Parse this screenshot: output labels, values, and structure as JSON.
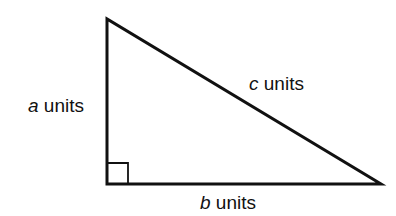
{
  "diagram": {
    "type": "right-triangle",
    "stroke_color": "#111111",
    "background": "#ffffff",
    "vertices": {
      "top": [
        107,
        19
      ],
      "right_angle": [
        107,
        184
      ],
      "right": [
        381,
        184
      ]
    },
    "right_angle_marker_size": 21,
    "labels": {
      "a": {
        "variable": "a",
        "unit": "units",
        "side": "vertical leg"
      },
      "b": {
        "variable": "b",
        "unit": "units",
        "side": "horizontal leg"
      },
      "c": {
        "variable": "c",
        "unit": "units",
        "side": "hypotenuse"
      }
    }
  }
}
